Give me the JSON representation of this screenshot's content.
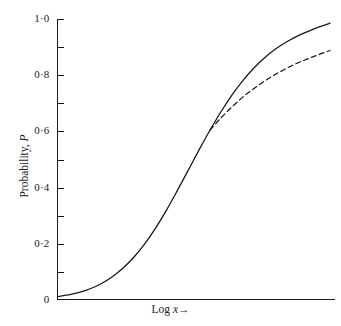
{
  "chart_data": {
    "type": "line",
    "title": "",
    "xlabel": "Log x→",
    "ylabel": "Probability, P",
    "xlim": [
      0,
      1
    ],
    "ylim": [
      0,
      1
    ],
    "grid": false,
    "legend": "none",
    "y_tick_labels": [
      "1·0",
      "0·8",
      "0·6",
      "0·4",
      "0·2",
      "0"
    ],
    "y_tick_values": [
      1.0,
      0.8,
      0.6,
      0.4,
      0.2,
      0
    ],
    "y_minor_tick_values": [
      0.9,
      0.7,
      0.5,
      0.3,
      0.1
    ],
    "x_tick_labels": [],
    "x_tick_values": [],
    "series": [
      {
        "name": "complete-response-curve",
        "style": "solid",
        "color": "#1a1a1a",
        "x": [
          0.0,
          0.04,
          0.08,
          0.12,
          0.16,
          0.2,
          0.24,
          0.28,
          0.32,
          0.36,
          0.4,
          0.44,
          0.48,
          0.52,
          0.56,
          0.6,
          0.64,
          0.68,
          0.72,
          0.76,
          0.8,
          0.84,
          0.88,
          0.92,
          0.96,
          1.0
        ],
        "values": [
          0.012,
          0.018,
          0.027,
          0.04,
          0.058,
          0.082,
          0.113,
          0.152,
          0.2,
          0.256,
          0.32,
          0.39,
          0.462,
          0.535,
          0.605,
          0.67,
          0.729,
          0.781,
          0.825,
          0.862,
          0.893,
          0.918,
          0.939,
          0.956,
          0.972,
          0.985
        ]
      },
      {
        "name": "partial-response-curve",
        "style": "dashed",
        "color": "#1a1a1a",
        "x": [
          0.56,
          0.6,
          0.64,
          0.68,
          0.72,
          0.76,
          0.8,
          0.84,
          0.88,
          0.92,
          0.96,
          1.0
        ],
        "values": [
          0.605,
          0.648,
          0.687,
          0.722,
          0.752,
          0.779,
          0.803,
          0.824,
          0.843,
          0.859,
          0.874,
          0.888
        ]
      }
    ],
    "annotations": [],
    "axis_color": "#1a1a1a",
    "background": "#ffffff"
  }
}
